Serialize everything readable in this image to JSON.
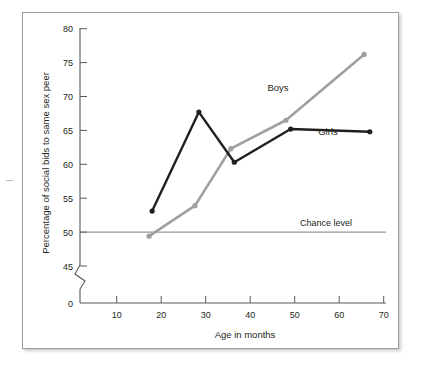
{
  "figure": {
    "background_color": "#ffffff",
    "frame_border_color": "#9b9b9b"
  },
  "chart_data": {
    "type": "line",
    "title": "",
    "xlabel": "Age in months",
    "ylabel": "Percentage of social bids to same sex peer",
    "xlim": [
      0,
      70
    ],
    "ylim": [
      45,
      80
    ],
    "y_axis_break": true,
    "y_break_from": 0,
    "y_break_to": 45,
    "xticks": [
      10,
      20,
      30,
      40,
      50,
      60,
      70
    ],
    "xtick_labels": [
      "10",
      "20",
      "30",
      "40",
      "50",
      "60",
      "70"
    ],
    "yticks": [
      0,
      45,
      50,
      55,
      60,
      65,
      70,
      75,
      80
    ],
    "ytick_labels": [
      "0",
      "45",
      "50",
      "55",
      "60",
      "65",
      "70",
      "75",
      "80"
    ],
    "grid": false,
    "legend_position": "inline-labels",
    "series": [
      {
        "name": "Boys",
        "color": "#a0a0a0",
        "label_text": "Boys",
        "x": [
          15.8,
          26.3,
          34.5,
          47.1,
          65.0
        ],
        "values": [
          49.4,
          53.9,
          62.3,
          66.5,
          76.2
        ]
      },
      {
        "name": "Girls",
        "color": "#231f20",
        "label_text": "Girls",
        "x": [
          16.5,
          27.2,
          35.3,
          48.2,
          66.3
        ],
        "values": [
          53.1,
          67.7,
          60.3,
          65.2,
          64.8
        ]
      }
    ],
    "annotations": [
      {
        "name": "chance-level",
        "text": "Chance level",
        "y_value": 50,
        "color": "#6d6e71"
      }
    ]
  }
}
